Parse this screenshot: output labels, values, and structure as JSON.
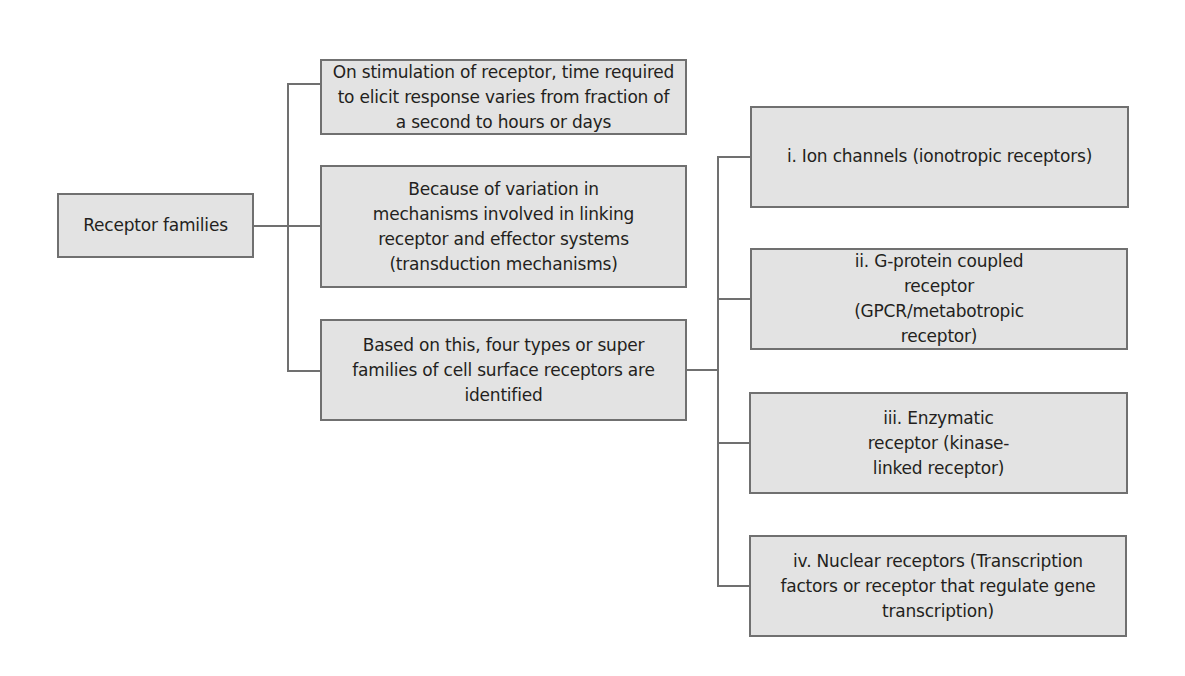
{
  "diagram": {
    "type": "tree",
    "colors": {
      "box_fill": "#e3e3e3",
      "box_border": "#707070",
      "connector": "#707070",
      "text": "#231f20",
      "background": "#ffffff"
    },
    "root": {
      "label": "Receptor families"
    },
    "level1": [
      {
        "id": "timing",
        "label": "On stimulation of receptor, time required to elicit response varies from fraction of a second to hours or days"
      },
      {
        "id": "mechanisms",
        "label": "Because of variation in mechanisms involved in linking receptor and effector systems (transduction mechanisms)"
      },
      {
        "id": "types",
        "label": "Based on this, four types or super families of cell surface receptors are identified"
      }
    ],
    "level2": [
      {
        "id": "ion-channels",
        "parent": "types",
        "label": "i. Ion channels (ionotropic receptors)"
      },
      {
        "id": "gpcr",
        "parent": "types",
        "label": "ii. G-protein coupled receptor (GPCR/metabotropic receptor)"
      },
      {
        "id": "enzymatic",
        "parent": "types",
        "label": "iii. Enzymatic receptor (kinase-linked receptor)"
      },
      {
        "id": "nuclear",
        "parent": "types",
        "label": "iv. Nuclear receptors (Transcription factors or receptor that regulate gene transcription)"
      }
    ]
  }
}
